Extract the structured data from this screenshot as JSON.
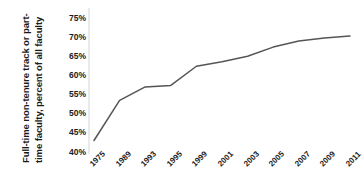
{
  "chart_data": {
    "type": "line",
    "title": "",
    "subtitle": "",
    "xlabel": "",
    "ylabel": "Full-time non-tenure track or part-time faculty, percent of all faculty",
    "ylabel_lines": [
      "Full-time non-tenure track or part-",
      "time faculty, percent of all faculty"
    ],
    "categories": [
      "1975",
      "1989",
      "1993",
      "1995",
      "1999",
      "2001",
      "2003",
      "2005",
      "2007",
      "2009",
      "2011"
    ],
    "x": [
      1975,
      1989,
      1993,
      1995,
      1999,
      2001,
      2003,
      2005,
      2007,
      2009,
      2011
    ],
    "values": [
      43.0,
      53.5,
      57.0,
      57.4,
      62.4,
      63.6,
      65.0,
      67.4,
      69.0,
      69.8,
      70.3
    ],
    "series": [
      {
        "name": "Full-time non-tenure track or part-time faculty",
        "values": [
          43.0,
          53.5,
          57.0,
          57.4,
          62.4,
          63.6,
          65.0,
          67.4,
          69.0,
          69.8,
          70.3
        ]
      }
    ],
    "ylim": [
      40,
      75
    ],
    "yticks": [
      40,
      45,
      50,
      55,
      60,
      65,
      70,
      75
    ],
    "ytick_labels": [
      "40%",
      "45%",
      "50%",
      "55%",
      "60%",
      "65%",
      "70%",
      "75%"
    ],
    "grid": false,
    "legend": false,
    "legend_position": "none",
    "line_color": "#555555",
    "marker": "none",
    "annotations": []
  }
}
